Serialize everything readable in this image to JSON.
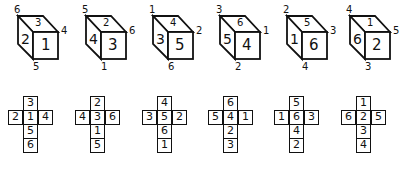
{
  "cubes": [
    {
      "top": "3",
      "left": "2",
      "front": "1",
      "corner_top_left": "6",
      "corner_right": "4",
      "corner_bottom": "5"
    },
    {
      "top": "2",
      "left": "4",
      "front": "3",
      "corner_top_left": "5",
      "corner_right": "6",
      "corner_bottom": "1"
    },
    {
      "top": "4",
      "left": "3",
      "front": "5",
      "corner_top_left": "1",
      "corner_right": "2",
      "corner_bottom": "6"
    },
    {
      "top": "6",
      "left": "5",
      "front": "4",
      "corner_top_left": "3",
      "corner_right": "1",
      "corner_bottom": "2"
    },
    {
      "top": "5",
      "left": "1",
      "front": "6",
      "corner_top_left": "2",
      "corner_right": "3",
      "corner_bottom": "4"
    },
    {
      "top": "1",
      "left": "6",
      "front": "2",
      "corner_top_left": "4",
      "corner_right": "5",
      "corner_bottom": "3"
    }
  ],
  "nets": [
    {
      "top": "3",
      "left": "2",
      "center": "1",
      "right": "4",
      "below": "5",
      "bottom": "6"
    },
    {
      "top": "2",
      "left": "4",
      "center": "3",
      "right": "6",
      "below": "1",
      "bottom": "5"
    },
    {
      "top": "4",
      "left": "3",
      "center": "5",
      "right": "2",
      "below": "6",
      "bottom": "1"
    },
    {
      "top": "6",
      "left": "5",
      "center": "4",
      "right": "1",
      "below": "2",
      "bottom": "3"
    },
    {
      "top": "5",
      "left": "1",
      "center": "6",
      "right": "3",
      "below": "4",
      "bottom": "2"
    },
    {
      "top": "1",
      "left": "6",
      "center": "2",
      "right": "5",
      "below": "3",
      "bottom": "4"
    }
  ]
}
